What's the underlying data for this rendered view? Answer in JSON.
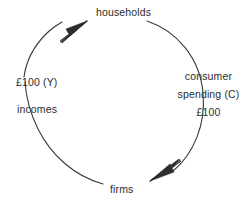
{
  "diagram": {
    "type": "circular-flow",
    "nodes": [
      {
        "id": "households",
        "label": "households",
        "position": "top"
      },
      {
        "id": "firms",
        "label": "firms",
        "position": "bottom"
      }
    ],
    "flows": [
      {
        "id": "consumer-spending",
        "side": "right",
        "from": "households",
        "to": "firms",
        "lines": [
          "consumer",
          "spending  (C)",
          "£100"
        ],
        "amount": "£100",
        "symbol": "C"
      },
      {
        "id": "incomes",
        "side": "left",
        "from": "firms",
        "to": "households",
        "lines": [
          "£100 (Y)",
          "incomes"
        ],
        "amount": "£100",
        "symbol": "Y"
      }
    ],
    "arrows": [
      {
        "id": "arrow-to-households",
        "points_to": "households",
        "direction": "north-east"
      },
      {
        "id": "arrow-to-firms",
        "points_to": "firms",
        "direction": "south-west"
      }
    ],
    "colors": {
      "background": "#ffffff",
      "stroke": "#3a3a3a",
      "text": "#2b2b2b"
    }
  }
}
